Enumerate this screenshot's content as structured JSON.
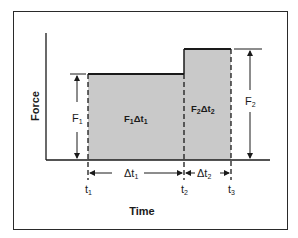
{
  "figure": {
    "x_axis_label": "Time",
    "y_axis_label": "Force",
    "regions": [
      {
        "label": "F",
        "label_sub": "1",
        "label_delta": "Δt",
        "label_delta_sub": "1"
      },
      {
        "label": "F",
        "label_sub": "2",
        "label_delta": "Δt",
        "label_delta_sub": "2"
      }
    ],
    "force_markers": [
      {
        "label": "F",
        "sub": "1"
      },
      {
        "label": "F",
        "sub": "2"
      }
    ],
    "interval_markers": [
      {
        "label": "Δt",
        "sub": "1"
      },
      {
        "label": "Δt",
        "sub": "2"
      }
    ],
    "time_ticks": [
      {
        "label": "t",
        "sub": "1"
      },
      {
        "label": "t",
        "sub": "2"
      },
      {
        "label": "t",
        "sub": "3"
      }
    ],
    "colors": {
      "fill": "#c9c9c9",
      "line": "#1a1a1a",
      "frame": "#2a2a2a"
    }
  }
}
